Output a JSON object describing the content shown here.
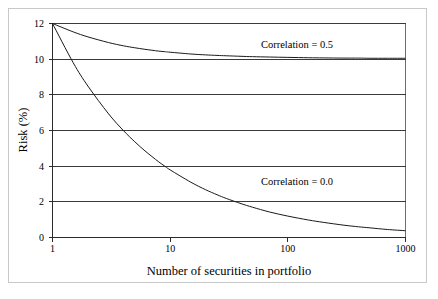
{
  "figure": {
    "background_color": "#ffffff",
    "frame_color": "#c8c8c8",
    "plot_background": "#ffffff",
    "curve_color": "#1a1a1a",
    "gridline_color": "#3a3a3a"
  },
  "chart_data": {
    "type": "line",
    "title": "",
    "subtitle": "",
    "xlabel": "Number of securities in portfolio",
    "ylabel": "Risk (%)",
    "xscale": "log",
    "yscale": "linear",
    "xlim": [
      1,
      1000
    ],
    "ylim": [
      0,
      12
    ],
    "xticks": [
      1,
      10,
      100,
      1000
    ],
    "xtick_labels": [
      "1",
      "10",
      "100",
      "1000"
    ],
    "yticks": [
      0,
      2,
      4,
      6,
      8,
      10,
      12
    ],
    "ytick_labels": [
      "0",
      "2",
      "4",
      "6",
      "8",
      "10",
      "12"
    ],
    "grid": {
      "horizontal": true,
      "vertical": false,
      "levels": [
        2,
        4,
        6,
        8,
        10,
        12
      ]
    },
    "legend": {
      "position": "inline-annotations",
      "entries": [
        "Correlation = 0.5",
        "Correlation = 0.0"
      ]
    },
    "annotations": [
      {
        "text": "Correlation = 0.5",
        "x": 120,
        "y": 10.85
      },
      {
        "text": "Correlation = 0.0",
        "x": 120,
        "y": 2.85
      }
    ],
    "x": [
      1,
      1.5,
      2,
      3,
      4,
      5,
      6,
      7,
      8,
      9,
      10,
      15,
      20,
      25,
      30,
      40,
      50,
      70,
      100,
      150,
      200,
      300,
      400,
      500,
      700,
      1000
    ],
    "series": [
      {
        "name": "Correlation = 0.5",
        "label": "Correlation = 0.5",
        "values": [
          12.0,
          11.53,
          11.25,
          10.93,
          10.75,
          10.64,
          10.56,
          10.5,
          10.45,
          10.42,
          10.39,
          10.29,
          10.24,
          10.21,
          10.19,
          10.16,
          10.14,
          10.12,
          10.1,
          10.08,
          10.07,
          10.06,
          10.06,
          10.05,
          10.05,
          10.05
        ]
      },
      {
        "name": "Correlation = 0.0",
        "label": "Correlation = 0.0",
        "values": [
          12.0,
          9.8,
          8.49,
          6.93,
          6.0,
          5.37,
          4.9,
          4.54,
          4.24,
          4.0,
          3.79,
          3.1,
          2.68,
          2.4,
          2.19,
          1.9,
          1.7,
          1.43,
          1.2,
          0.98,
          0.85,
          0.69,
          0.6,
          0.54,
          0.45,
          0.38
        ]
      }
    ]
  }
}
